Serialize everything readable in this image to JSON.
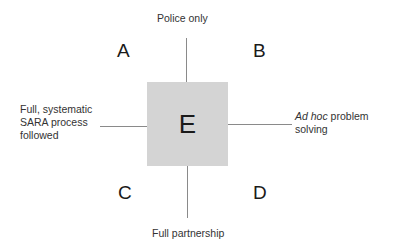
{
  "diagram": {
    "axes": {
      "top": "Police only",
      "bottom": "Full partnership",
      "left_lines": [
        "Full, systematic",
        "SARA process",
        "followed"
      ],
      "right_italic": "Ad hoc",
      "right_rest_line1": " problem",
      "right_line2": "solving"
    },
    "quadrants": {
      "top_left": "A",
      "top_right": "B",
      "bottom_left": "C",
      "bottom_right": "D"
    },
    "center": "E",
    "colors": {
      "center_fill": "#d4d4d4",
      "axis_line": "#8a8a8a"
    }
  }
}
